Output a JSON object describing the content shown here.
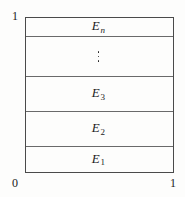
{
  "figure": {
    "name": "partition-of-unit-interval-diagram",
    "colors": {
      "background": "#fdfdfc",
      "outer_border": "#4a4a4a",
      "divider": "#6a6a6a",
      "text": "#1b1b1b"
    }
  },
  "axis_labels": {
    "top_left": "1",
    "bottom_left": "0",
    "bottom_right": "1"
  },
  "bands": [
    {
      "id": "band-en",
      "base": "E",
      "subscript": "n",
      "subscript_style": "italic",
      "label": "E n",
      "order_from_top": 1
    },
    {
      "id": "band-dots",
      "base": "",
      "subscript": "",
      "subscript_style": "",
      "label": "⋮",
      "order_from_top": 2
    },
    {
      "id": "band-e3",
      "base": "E",
      "subscript": "3",
      "subscript_style": "roman",
      "label": "E 3",
      "order_from_top": 3
    },
    {
      "id": "band-e2",
      "base": "E",
      "subscript": "2",
      "subscript_style": "roman",
      "label": "E 2",
      "order_from_top": 4
    },
    {
      "id": "band-e1",
      "base": "E",
      "subscript": "1",
      "subscript_style": "roman",
      "label": "E 1",
      "order_from_top": 5
    }
  ],
  "ellipsis": {
    "glyph": "vertical-ellipsis",
    "dot_count": 3
  }
}
